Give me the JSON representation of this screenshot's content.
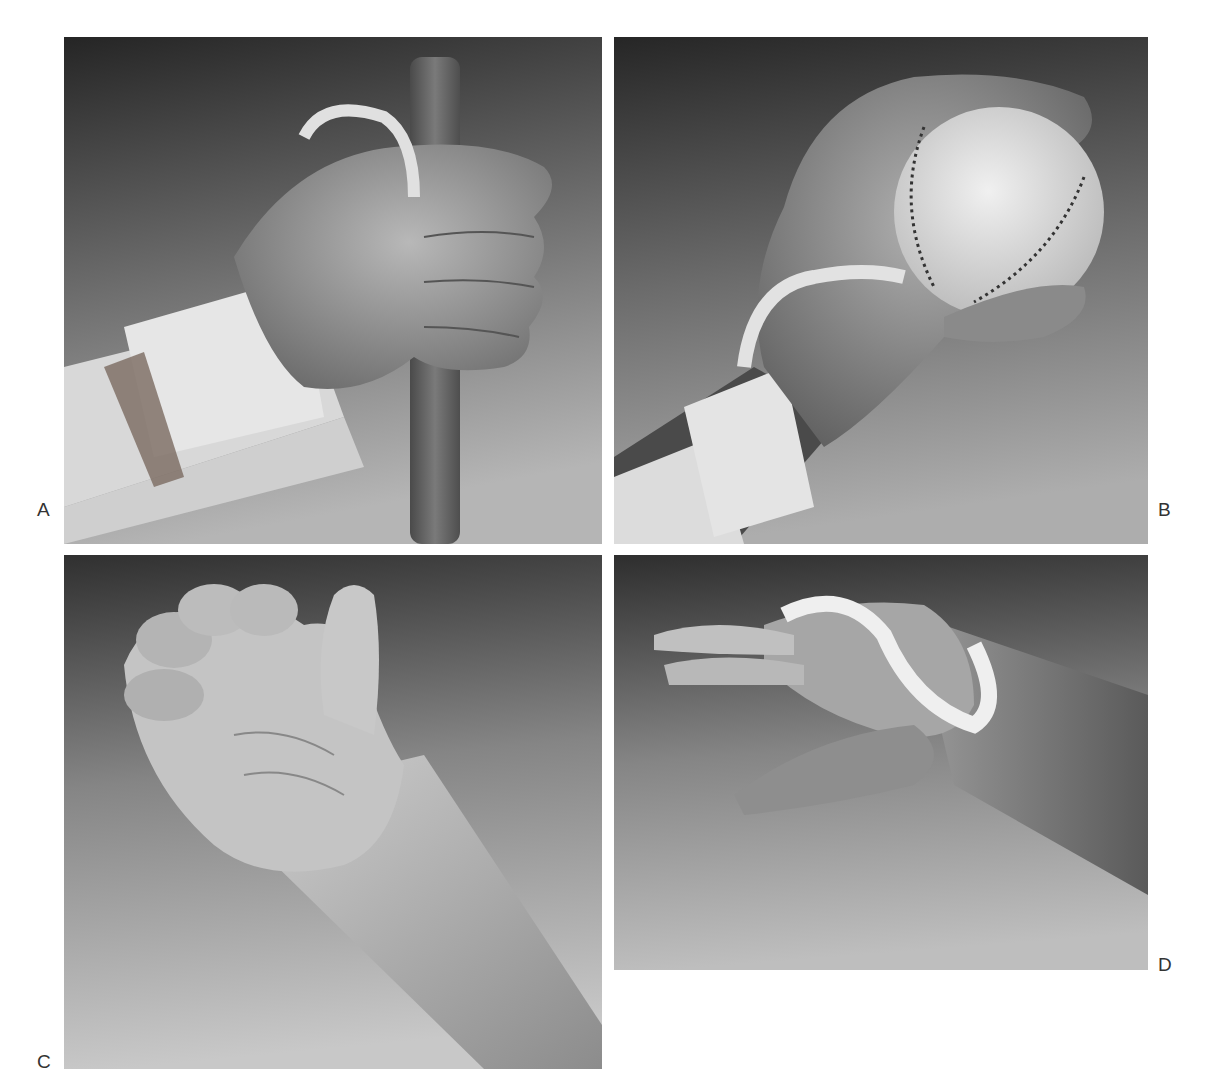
{
  "figure": {
    "panels": [
      {
        "id": "A",
        "label": "A",
        "description": "Hand gripping a wooden dowel, wearing a white wrist cuff with an elastic strap looped around the fingers",
        "background_gradient": [
          "#2a2a2a",
          "#7a7a7a",
          "#b8b8b8"
        ]
      },
      {
        "id": "B",
        "label": "B",
        "description": "Hand holding a baseball, with a white wrist cuff and strap around the palm",
        "background_gradient": [
          "#2c2c2c",
          "#777777",
          "#b0b0b0"
        ]
      },
      {
        "id": "C",
        "label": "C",
        "description": "Hand with fingers curled into a hook position and thumb extended, forearm visible",
        "background_gradient": [
          "#3a3a3a",
          "#8a8a8a",
          "#c4c4c4"
        ]
      },
      {
        "id": "D",
        "label": "D",
        "description": "Hand with a white loop strap around the fingers and thumb in extension",
        "background_gradient": [
          "#333333",
          "#888888",
          "#c0c0c0"
        ]
      }
    ]
  }
}
